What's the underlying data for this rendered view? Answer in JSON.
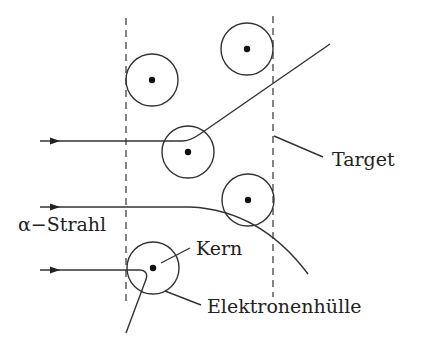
{
  "diagram": {
    "labels": {
      "target": "Target",
      "beam": "α−Strahl",
      "nucleus": "Kern",
      "electron_shell": "Elektronenhülle"
    },
    "colors": {
      "line": "#333333",
      "text": "#222222",
      "background": "#ffffff"
    },
    "target_boundaries": [
      {
        "x": 126,
        "y1": 18,
        "y2": 305
      },
      {
        "x": 273,
        "y1": 16,
        "y2": 297
      }
    ],
    "atoms": [
      {
        "cx": 152,
        "cy": 80,
        "r": 26
      },
      {
        "cx": 247,
        "cy": 49,
        "r": 26
      },
      {
        "cx": 188,
        "cy": 152,
        "r": 26
      },
      {
        "cx": 248,
        "cy": 200,
        "r": 26
      },
      {
        "cx": 153,
        "cy": 268,
        "r": 26
      }
    ],
    "trajectories": [
      {
        "name": "small-deflection",
        "path": "M40 141 L182 141 Q190 141 200 134 L330 44"
      },
      {
        "name": "medium-deflection",
        "path": "M40 207 L190 207 Q260 210 308 274"
      },
      {
        "name": "backscatter",
        "path": "M40 270 L140 270 Q150 271 145 282 L126 333"
      }
    ]
  }
}
